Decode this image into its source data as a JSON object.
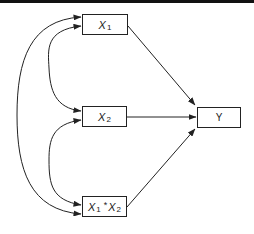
{
  "diagram": {
    "type": "path-diagram",
    "nodes": {
      "x1": {
        "label": "X",
        "subscript": "1"
      },
      "x2": {
        "label": "X",
        "subscript": "2"
      },
      "x1x2": {
        "label_a": "X",
        "subscript_a": "1",
        "operator": "*",
        "label_b": "X",
        "subscript_b": "2"
      },
      "y": {
        "label": "Y"
      }
    },
    "edges": [
      {
        "from": "X1",
        "to": "Y",
        "kind": "directed"
      },
      {
        "from": "X2",
        "to": "Y",
        "kind": "directed"
      },
      {
        "from": "X1*X2",
        "to": "Y",
        "kind": "directed"
      },
      {
        "from": "X1",
        "to": "X2",
        "kind": "covariance"
      },
      {
        "from": "X2",
        "to": "X1*X2",
        "kind": "covariance"
      },
      {
        "from": "X1",
        "to": "X1*X2",
        "kind": "covariance"
      }
    ],
    "colors": {
      "stroke": "#222222",
      "background": "#ffffff",
      "topbar": "#111111"
    }
  }
}
